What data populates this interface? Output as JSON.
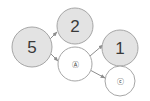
{
  "diagram": {
    "type": "directed-graph",
    "background_color": "#ffffff",
    "node_fill_filled": "#e3e3e3",
    "node_fill_empty": "#ffffff",
    "node_stroke": "#a6a6a6",
    "edge_color": "#8d8d8d",
    "label_color": "#3a3a3a",
    "nodes": [
      {
        "id": "n5",
        "label": "5",
        "label_kind": "number",
        "style": "filled",
        "cx": 32,
        "cy": 47,
        "r": 20,
        "fill": "#e3e3e3"
      },
      {
        "id": "n2",
        "label": "2",
        "label_kind": "number",
        "style": "filled",
        "cx": 75,
        "cy": 26,
        "r": 18,
        "fill": "#e3e3e3"
      },
      {
        "id": "nmid",
        "label": "Ⓐ",
        "label_kind": "circled-glyph",
        "style": "empty",
        "cx": 75,
        "cy": 64,
        "r": 17,
        "fill": "#ffffff"
      },
      {
        "id": "n1",
        "label": "1",
        "label_kind": "number",
        "style": "filled",
        "cx": 120,
        "cy": 48,
        "r": 18,
        "fill": "#e3e3e3"
      },
      {
        "id": "nbot",
        "label": "ⓒ",
        "label_kind": "circled-glyph",
        "style": "empty",
        "cx": 120,
        "cy": 81,
        "r": 15,
        "fill": "#ffffff"
      }
    ],
    "edges": [
      {
        "id": "e1",
        "from": "n5",
        "to": "n2",
        "x1": 50,
        "y1": 39,
        "x2": 57,
        "y2": 32
      },
      {
        "id": "e2",
        "from": "n5",
        "to": "nmid",
        "x1": 51,
        "y1": 54,
        "x2": 58,
        "y2": 61
      },
      {
        "id": "e3",
        "from": "nmid",
        "to": "n1",
        "x1": 90,
        "y1": 56,
        "x2": 103,
        "y2": 45
      },
      {
        "id": "e4",
        "from": "nmid",
        "to": "nbot",
        "x1": 90,
        "y1": 70,
        "x2": 105,
        "y2": 78
      }
    ]
  }
}
